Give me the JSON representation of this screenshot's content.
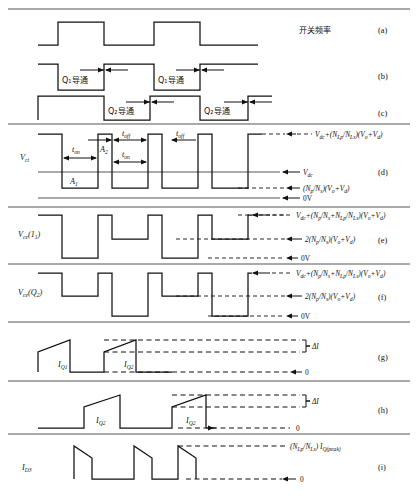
{
  "figure": {
    "title_note": "开关频率",
    "rows": [
      {
        "id": "a",
        "index_label": "(a)",
        "left_label": "",
        "right_note": "开关频率",
        "signal": "square-clock",
        "annotations": []
      },
      {
        "id": "b",
        "index_label": "(b)",
        "left_label": "",
        "signal": "q1-drive",
        "annotations": [
          "Q",
          "1",
          "导通",
          "Q",
          "1",
          "导通"
        ],
        "pulse_labels": [
          "Q₁导通",
          "Q₁导通"
        ]
      },
      {
        "id": "c",
        "index_label": "(c)",
        "left_label": "",
        "signal": "q2-drive",
        "pulse_labels": [
          "Q₂导通",
          "Q₂导通"
        ]
      },
      {
        "id": "d",
        "index_label": "(d)",
        "left_label": "V",
        "left_label_sub": "ct",
        "signal": "vct",
        "time_labels": [
          "t",
          "on",
          "t",
          "off",
          "t",
          "on",
          "t",
          "off"
        ],
        "area_labels": [
          "A",
          "1",
          "A",
          "2"
        ],
        "levels": [
          {
            "name": "top",
            "text_main": "V",
            "text_sub": "dc",
            "text_rest": "+(N",
            "formula": "Vdc+(NLp/NLs)(Vo+Vd)"
          },
          {
            "name": "mid",
            "formula": "Vdc"
          },
          {
            "name": "low",
            "formula": "(Np/Ns)(Vo+Vd)"
          },
          {
            "name": "zero",
            "formula": "0V"
          }
        ]
      },
      {
        "id": "e",
        "index_label": "(e)",
        "left_label": "V",
        "left_label_sub": "ce",
        "left_label_arg": "(Q",
        "left_label_argsub": "1",
        "left_label_close": ")",
        "signal": "vce-q1",
        "levels": [
          {
            "formula": "Vdc+(Np/Ns+NLp/NLs)(Vo+Vd)"
          },
          {
            "formula": "2(Np/Ns)(Vo+Vd)"
          },
          {
            "formula": "0V"
          }
        ]
      },
      {
        "id": "f",
        "index_label": "(f)",
        "left_label": "V",
        "left_label_sub": "ce",
        "left_label_arg": "(Q",
        "left_label_argsub": "2",
        "left_label_close": ")",
        "signal": "vce-q2",
        "levels": [
          {
            "formula": "Vdc+(Np/Ns+NLp/NLs)(Vo+Vd)"
          },
          {
            "formula": "2(Np/Ns)(Vo+Vd)"
          },
          {
            "formula": "0V"
          }
        ]
      },
      {
        "id": "g",
        "index_label": "(g)",
        "left_label": "",
        "signal": "iq1",
        "curve_labels": [
          "I",
          "Q1",
          "I",
          "Q1"
        ],
        "delta_label": "ΔI",
        "zero_label": "0"
      },
      {
        "id": "h",
        "index_label": "(h)",
        "left_label": "",
        "signal": "iq2",
        "curve_labels": [
          "I",
          "Q2",
          "I",
          "Q2"
        ],
        "delta_label": "ΔI",
        "zero_label": "0"
      },
      {
        "id": "i",
        "index_label": "(i)",
        "left_label": "I",
        "left_label_sub": "D3",
        "signal": "id3",
        "peak_label": "(NLp/NLs) IQ(peak)",
        "zero_label": "0"
      }
    ],
    "symbols": {
      "V": "V",
      "I": "I",
      "N": "N",
      "t": "t",
      "A": "A",
      "delta_I": "ΔI",
      "zero": "0",
      "zero_volt": "0V",
      "dc": "dc",
      "ct": "ct",
      "ce": "ce",
      "on": "on",
      "off": "off",
      "Lp": "Lp",
      "Ls": "Ls",
      "p": "p",
      "s": "s",
      "o": "o",
      "d": "d",
      "Q1": "Q1",
      "Q2": "Q2",
      "D3": "D3",
      "Qpeak": "Q(peak)",
      "cn_q1_on": "Q₁导通",
      "cn_q2_on": "Q₂导通",
      "cn_switch_freq": "开关频率",
      "plus": "+",
      "slash": "/",
      "lparen": "(",
      "rparen": ")"
    },
    "colors": {
      "ink": "#111111",
      "rule": "#555555",
      "background": "#ffffff"
    }
  }
}
